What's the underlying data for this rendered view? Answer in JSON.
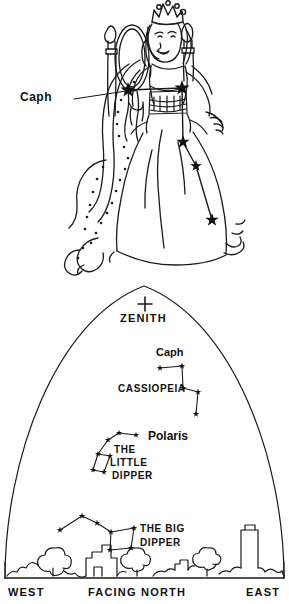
{
  "document": {
    "title": "Cassiopeia the Queen and the Northern Sky",
    "panels": [
      "constellation-figure",
      "sky-dome-chart"
    ]
  },
  "figure_panel": {
    "name": "cassiopeia-queen-figure",
    "description": "Line drawing of Queen Cassiopeia seated on her throne holding a mirror, with the five stars of the W asterism marked on her body",
    "callout": {
      "label": "Caph",
      "points_to": "leftmost-star"
    },
    "stars": [
      {
        "name": "Caph",
        "x": 128,
        "y": 90,
        "size": 8
      },
      {
        "name": "Schedar",
        "x": 182,
        "y": 88,
        "size": 8
      },
      {
        "name": "Gamma Cas",
        "x": 183,
        "y": 142,
        "size": 7
      },
      {
        "name": "Ruchbah",
        "x": 196,
        "y": 166,
        "size": 6
      },
      {
        "name": "Segin",
        "x": 212,
        "y": 220,
        "size": 7
      }
    ]
  },
  "sky_chart": {
    "name": "facing-north-sky-dome",
    "zenith": {
      "label": "ZENITH",
      "marker": "plus-cross"
    },
    "horizon_labels": {
      "west": "WEST",
      "center": "FACING NORTH",
      "east": "EAST"
    },
    "constellations": [
      {
        "name": "CASSIOPEIA",
        "label": "CASSIOPEIA",
        "star_label": "Caph",
        "stars": [
          {
            "x": 160,
            "y": 88
          },
          {
            "x": 182,
            "y": 86
          },
          {
            "x": 183,
            "y": 108
          },
          {
            "x": 198,
            "y": 112
          },
          {
            "x": 196,
            "y": 134
          }
        ]
      },
      {
        "name": "THE LITTLE DIPPER",
        "label_line1": "THE",
        "label_line2": "LITTLE",
        "label_line3": "DIPPER",
        "star_label": "Polaris",
        "stars": [
          {
            "x": 136,
            "y": 155
          },
          {
            "x": 119,
            "y": 153
          },
          {
            "x": 108,
            "y": 160
          },
          {
            "x": 98,
            "y": 174
          },
          {
            "x": 93,
            "y": 190
          },
          {
            "x": 104,
            "y": 192
          },
          {
            "x": 110,
            "y": 176
          }
        ]
      },
      {
        "name": "THE BIG DIPPER",
        "label_line1": "THE BIG",
        "label_line2": "DIPPER",
        "stars": [
          {
            "x": 60,
            "y": 250
          },
          {
            "x": 82,
            "y": 236
          },
          {
            "x": 97,
            "y": 243
          },
          {
            "x": 111,
            "y": 252
          },
          {
            "x": 134,
            "y": 248
          },
          {
            "x": 131,
            "y": 268
          },
          {
            "x": 110,
            "y": 270
          }
        ]
      }
    ],
    "horizon": {
      "description": "skyline silhouette of trees, houses and a tall building"
    }
  },
  "colors": {
    "ink": "#1a1a1a",
    "paper": "#ffffff"
  }
}
